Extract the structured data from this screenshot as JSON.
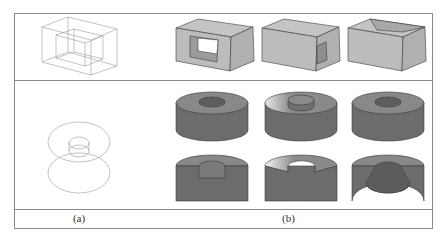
{
  "figure": {
    "captions": {
      "a": "(a)",
      "b": "(b)"
    },
    "rows": [
      {
        "name": "box-row",
        "wireframe": "box-wireframe",
        "solids": [
          "box-through-hole",
          "box-side-pocket",
          "box-top-pocket"
        ]
      },
      {
        "name": "ring-row",
        "wireframe": "torus-wireframe",
        "solids": [
          "ring-variant-1",
          "ring-variant-2",
          "ring-variant-3"
        ],
        "sections": [
          "ring-section-1",
          "ring-section-2",
          "ring-section-3"
        ]
      }
    ],
    "colors": {
      "border": "#8a8a8a",
      "wire": "#9a9a9a",
      "box_face_light": "#c8c8c8",
      "box_face_mid": "#b4b4b4",
      "box_face_dark": "#9e9e9e",
      "ring_side": "#6c6c6c",
      "ring_top": "#888888",
      "edge": "#3a3a3a"
    }
  }
}
